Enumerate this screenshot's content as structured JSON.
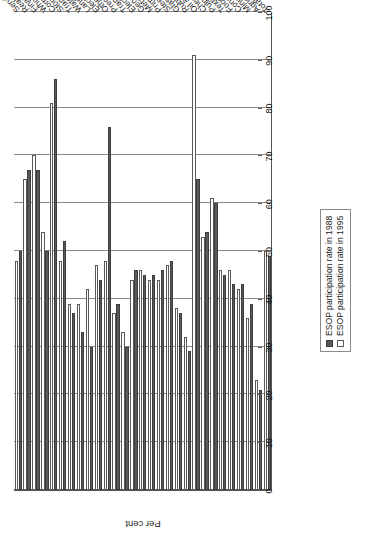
{
  "chart_data": {
    "type": "bar",
    "title": "",
    "xlabel": "",
    "ylabel": "Per cent",
    "ylim": [
      0,
      100
    ],
    "ytick_step": 10,
    "yticks": [
      "0",
      "10",
      "20",
      "30",
      "40",
      "50",
      "60",
      "70",
      "80",
      "90",
      "100"
    ],
    "grid": true,
    "orientation": "rotated-90ccw",
    "legend_position": "bottom-right",
    "colors": {
      "series1": "#595959",
      "series2": "#ffffff",
      "series2_border": "#5a5a5a",
      "grid": "#8a8a8a",
      "axis": "#555555"
    },
    "categories": [
      "Total",
      "Agriculture",
      "Mining",
      "Construction",
      "Food",
      "Textiles",
      "Pulp & paper",
      "Chemicals",
      "Oil & coal",
      "Rubber",
      "Glass & stone",
      "Steel",
      "Primary metals",
      "Metals",
      "General machinery",
      "Electrical machinery",
      "Trans. equip.",
      "Precision instr.",
      "Other manufacturing",
      "Electric & gas",
      "Land transportation",
      "Water transportation",
      "Transportation by air",
      "Storage",
      "Communications",
      "Wholesale & retail",
      "Finance & insurance",
      "Real estate",
      "Services"
    ],
    "series": [
      {
        "name": "ESOP participation rate in 1988",
        "values": [
          49,
          21,
          39,
          43,
          43,
          45,
          60,
          54,
          65,
          29,
          37,
          48,
          46,
          45,
          45,
          46,
          30,
          39,
          76,
          44,
          30,
          33,
          37,
          52,
          86,
          50,
          67,
          67,
          50
        ]
      },
      {
        "name": "ESOP participation rate in 1995",
        "values": [
          50,
          23,
          36,
          42,
          46,
          46,
          61,
          53,
          91,
          32,
          38,
          47,
          44,
          44,
          46,
          44,
          33,
          37,
          48,
          47,
          42,
          39,
          39,
          48,
          81,
          54,
          70,
          65,
          48
        ]
      }
    ]
  },
  "legend": {
    "items": [
      {
        "label": "ESOP participation rate in 1988",
        "swatch": "dark"
      },
      {
        "label": "ESOP participation rate in 1995",
        "swatch": "light"
      }
    ]
  },
  "axis": {
    "value_axis_title": "Per cent"
  }
}
